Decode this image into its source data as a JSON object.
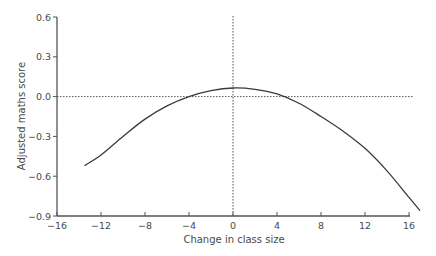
{
  "chart_data": {
    "type": "line",
    "title": "",
    "xlabel": "Change in class size",
    "ylabel": "Adjusted maths score",
    "xlim": [
      -16,
      16
    ],
    "ylim": [
      -0.9,
      0.6
    ],
    "xticks": [
      -16,
      -12,
      -8,
      -4,
      0,
      4,
      8,
      12,
      16
    ],
    "xtick_labels": [
      "−16",
      "−12",
      "−8",
      "−4",
      "0",
      "4",
      "8",
      "12",
      "16"
    ],
    "yticks": [
      0.6,
      0.3,
      0.0,
      -0.3,
      -0.6,
      -0.9
    ],
    "ytick_labels": [
      "0.6",
      "0.3",
      "0.0",
      "−0.3",
      "−0.6",
      "−0.9"
    ],
    "grid": false,
    "reference_lines": [
      {
        "orientation": "horizontal",
        "value": 0.0,
        "style": "dotted"
      },
      {
        "orientation": "vertical",
        "value": 0,
        "style": "dotted"
      }
    ],
    "series": [
      {
        "name": "fitted curve",
        "x": [
          -13.5,
          -12,
          -10,
          -8,
          -6,
          -4,
          -2,
          0,
          2,
          4,
          6,
          8,
          10,
          12,
          14,
          16,
          17
        ],
        "y": [
          -0.52,
          -0.44,
          -0.3,
          -0.17,
          -0.07,
          0.0,
          0.045,
          0.065,
          0.055,
          0.02,
          -0.05,
          -0.15,
          -0.26,
          -0.39,
          -0.56,
          -0.76,
          -0.86
        ]
      }
    ],
    "legend": null
  },
  "colors": {
    "axis": "#555555",
    "curve": "#3a3a3a",
    "reference": "#555555"
  }
}
